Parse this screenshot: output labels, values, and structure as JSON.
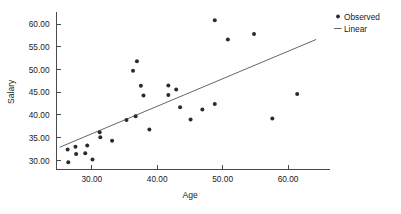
{
  "chart_data": {
    "type": "scatter",
    "title": "",
    "xlabel": "Age",
    "ylabel": "Salary",
    "xlim": [
      24.6,
      65.5
    ],
    "ylim": [
      28.0,
      62.2
    ],
    "grid": false,
    "legend_position": "top-right",
    "xticks": [
      30.0,
      40.0,
      50.0,
      60.0
    ],
    "xtick_labels": [
      "30.00",
      "40.00",
      "50.00",
      "60.00"
    ],
    "yticks": [
      30.0,
      35.0,
      40.0,
      45.0,
      50.0,
      55.0,
      60.0
    ],
    "ytick_labels": [
      "30.00",
      "35.00",
      "40.00",
      "45.00",
      "50.00",
      "55.00",
      "60.00"
    ],
    "series": [
      {
        "name": "Observed",
        "marker": "dot",
        "color": "#2b2b2b",
        "points": [
          [
            26.3,
            32.4
          ],
          [
            26.4,
            29.6
          ],
          [
            27.5,
            33.0
          ],
          [
            27.6,
            31.4
          ],
          [
            29.0,
            31.6
          ],
          [
            29.3,
            33.3
          ],
          [
            30.1,
            30.2
          ],
          [
            31.2,
            36.2
          ],
          [
            31.3,
            35.1
          ],
          [
            33.1,
            34.3
          ],
          [
            35.3,
            38.9
          ],
          [
            36.3,
            49.7
          ],
          [
            36.7,
            39.7
          ],
          [
            36.9,
            51.8
          ],
          [
            37.5,
            46.4
          ],
          [
            37.9,
            44.3
          ],
          [
            38.8,
            36.8
          ],
          [
            41.7,
            46.5
          ],
          [
            41.7,
            44.4
          ],
          [
            42.9,
            45.6
          ],
          [
            43.5,
            41.7
          ],
          [
            45.1,
            39.0
          ],
          [
            46.9,
            41.2
          ],
          [
            48.8,
            42.4
          ],
          [
            48.8,
            60.8
          ],
          [
            50.8,
            56.6
          ],
          [
            54.8,
            57.8
          ],
          [
            57.6,
            39.2
          ],
          [
            61.4,
            44.6
          ]
        ]
      },
      {
        "name": "Linear",
        "marker": "line",
        "color": "#555555",
        "line_endpoints": [
          [
            25.1,
            32.9
          ],
          [
            64.3,
            56.6
          ]
        ]
      }
    ],
    "legend": [
      "Observed",
      "Linear"
    ]
  },
  "legend": {
    "observed_label": "Observed",
    "linear_label": "Linear"
  },
  "axes": {
    "x_title": "Age",
    "y_title": "Salary"
  }
}
